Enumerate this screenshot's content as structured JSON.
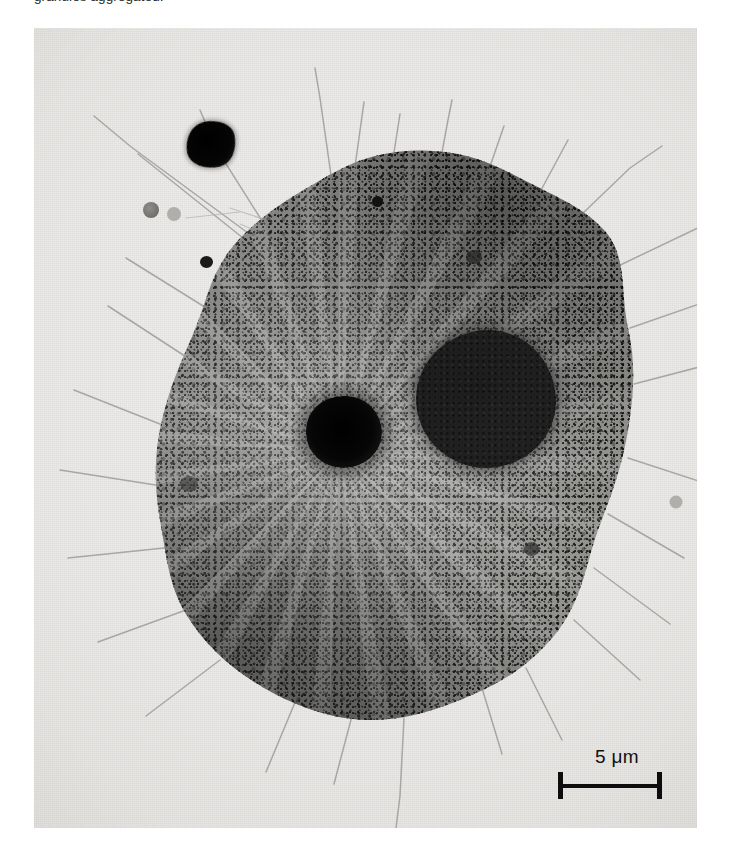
{
  "caption": {
    "text": "granules aggregated.",
    "note": "partially cropped at top edge of page"
  },
  "figure": {
    "kind": "micrograph",
    "plate_background_color": "#ececea",
    "cytoplasm_color": "#1b1b1b",
    "nucleus_color": "#1e1e1e",
    "centrosome_color": "#000000",
    "debris_color": "#000000"
  },
  "scalebar": {
    "label": "5 μm",
    "value": 5,
    "unit": "μm",
    "bar_color": "#0d0d0d",
    "position": "bottom-right"
  },
  "features": {
    "nucleus_label": "nucleus",
    "centrosome_label": "centrosome",
    "debris_label": "electron-dense particle",
    "filopodia_label": "filopodia",
    "cytoplasm_label": "granular cytoplasm"
  }
}
